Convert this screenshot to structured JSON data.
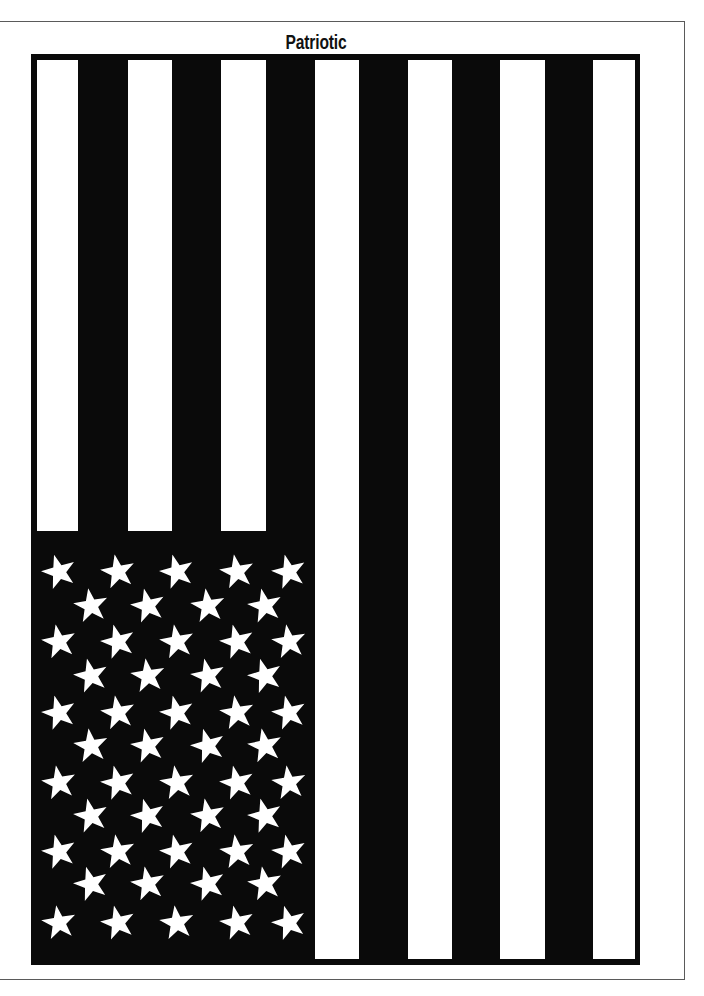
{
  "page": {
    "title": "Patriotic",
    "orientation": "vertical"
  },
  "colors": {
    "background": "#ffffff",
    "ink": "#0a0a0a",
    "frame": "#5a5a5a"
  },
  "flag": {
    "stripe_count": 13,
    "white_stripe_count": 7,
    "star_count": 50,
    "star_rows": [
      {
        "count": 5,
        "y": 572,
        "x": [
          59,
          118,
          177,
          237,
          289
        ]
      },
      {
        "count": 4,
        "y": 606,
        "x": [
          91,
          148,
          208,
          265
        ]
      },
      {
        "count": 5,
        "y": 642,
        "x": [
          59,
          118,
          177,
          237,
          289
        ]
      },
      {
        "count": 4,
        "y": 676,
        "x": [
          91,
          148,
          208,
          265
        ]
      },
      {
        "count": 5,
        "y": 713,
        "x": [
          59,
          118,
          177,
          237,
          289
        ]
      },
      {
        "count": 4,
        "y": 746,
        "x": [
          91,
          148,
          208,
          265
        ]
      },
      {
        "count": 5,
        "y": 783,
        "x": [
          59,
          118,
          177,
          237,
          289
        ]
      },
      {
        "count": 4,
        "y": 816,
        "x": [
          91,
          148,
          208,
          265
        ]
      },
      {
        "count": 5,
        "y": 852,
        "x": [
          59,
          118,
          177,
          237,
          289
        ]
      },
      {
        "count": 4,
        "y": 884,
        "x": [
          91,
          148,
          208,
          265
        ]
      },
      {
        "count": 5,
        "y": 923,
        "x": [
          59,
          118,
          177,
          237,
          289
        ]
      }
    ]
  }
}
